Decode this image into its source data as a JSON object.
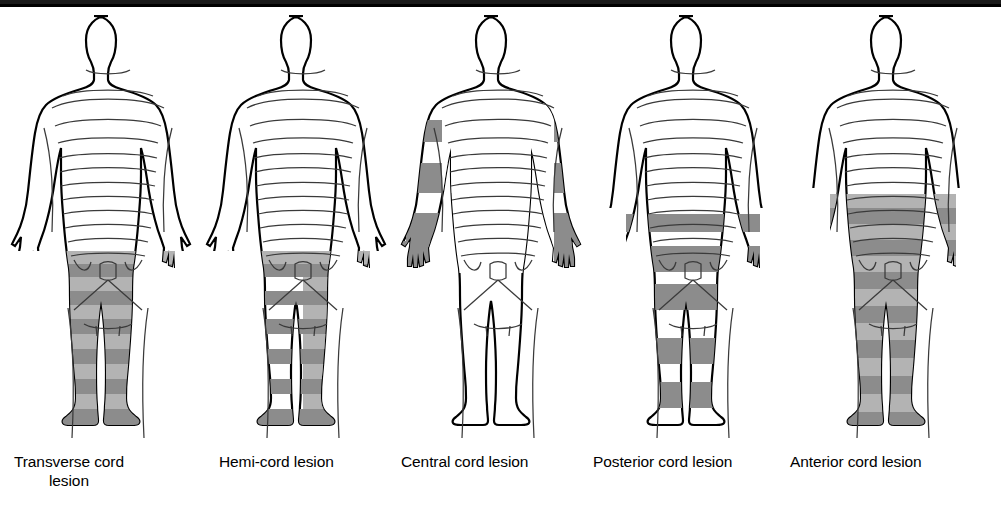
{
  "figure_panels": [
    {
      "id": "transverse-cord-lesion",
      "label": "Transverse cord\nlesion",
      "label_line1": "Transverse cord",
      "label_line2": "lesion",
      "x": 8,
      "label_x": 14,
      "pattern": "bilateral-banded-lower",
      "arms_shaded": false,
      "hands_shaded": false,
      "torso_shaded": false,
      "legs": "both-banded"
    },
    {
      "id": "hemi-cord-lesion",
      "label": "Hemi-cord lesion",
      "label_line1": "Hemi-cord lesion",
      "label_line2": "",
      "x": 203,
      "label_x": 219,
      "pattern": "asymmetric-lower",
      "arms_shaded": false,
      "hands_shaded": false,
      "torso_shaded": false,
      "legs": "right-continuous-left-banded"
    },
    {
      "id": "central-cord-lesion",
      "label": "Central cord lesion",
      "label_line1": "Central cord lesion",
      "label_line2": "",
      "x": 398,
      "label_x": 401,
      "pattern": "cape-distribution",
      "arms_shaded": true,
      "hands_shaded": true,
      "torso_shaded": false,
      "legs": "unshaded"
    },
    {
      "id": "posterior-cord-lesion",
      "label": "Posterior cord lesion",
      "label_line1": "Posterior cord lesion",
      "label_line2": "",
      "x": 593,
      "label_x": 593,
      "pattern": "uniform-bands-lower",
      "arms_shaded": false,
      "hands_shaded": false,
      "torso_shaded": true,
      "legs": "both-uniform-banded"
    },
    {
      "id": "anterior-cord-lesion",
      "label": "Anterior cord lesion",
      "label_line1": "Anterior cord lesion",
      "label_line2": "",
      "x": 793,
      "label_x": 790,
      "pattern": "continuous-from-midtorso",
      "arms_shaded": false,
      "hands_shaded": false,
      "torso_shaded": true,
      "legs": "both-continuous-banded"
    }
  ],
  "colors": {
    "outline": "#000000",
    "dermatome_line": "#3a3a3a",
    "shade_light": "#b3b3b3",
    "shade_dark": "#8c8c8c",
    "background": "#ffffff",
    "top_rule": "#000000"
  }
}
